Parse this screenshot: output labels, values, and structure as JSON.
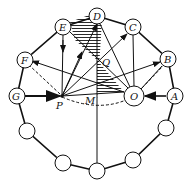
{
  "diagram": {
    "labels": {
      "A": "A",
      "B": "B",
      "C": "C",
      "D": "D",
      "E": "E",
      "F": "F",
      "G": "G",
      "O": "O",
      "P": "P",
      "M": "M",
      "Q": "Q"
    },
    "colors": {
      "stroke": "#111111",
      "background": "#ffffff"
    },
    "nodes": [
      {
        "id": "D",
        "x": 97,
        "y": 16,
        "r": 8
      },
      {
        "id": "E",
        "x": 63,
        "y": 27,
        "r": 8
      },
      {
        "id": "C",
        "x": 133,
        "y": 27,
        "r": 8
      },
      {
        "id": "F",
        "x": 25,
        "y": 60,
        "r": 8
      },
      {
        "id": "B",
        "x": 168,
        "y": 59,
        "r": 8
      },
      {
        "id": "G",
        "x": 17,
        "y": 96,
        "r": 8
      },
      {
        "id": "A",
        "x": 175,
        "y": 96,
        "r": 8
      },
      {
        "id": "O",
        "x": 134,
        "y": 96,
        "r": 10
      }
    ]
  }
}
